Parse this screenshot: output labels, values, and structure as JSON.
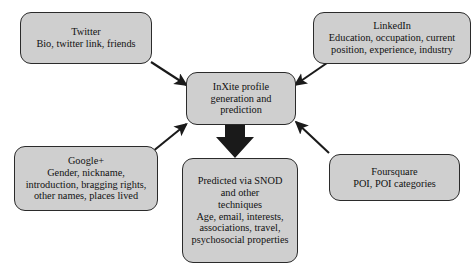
{
  "diagram": {
    "colors": {
      "node_fill": "#cfcfcf",
      "node_border": "#2b2b2b",
      "arrow": "#1a1a1a",
      "background": "#ffffff",
      "text": "#111111"
    },
    "nodes": {
      "twitter": {
        "name": "Twitter",
        "lines": [
          "Twitter",
          "Bio, twitter link, friends"
        ]
      },
      "linkedin": {
        "name": "LinkedIn",
        "lines": [
          "LinkedIn",
          "Education, occupation, current",
          "position, experience, industry"
        ]
      },
      "googleplus": {
        "name": "Google+",
        "lines": [
          "Google+",
          "Gender, nickname,",
          "introduction, bragging rights,",
          "other names, places lived"
        ]
      },
      "foursquare": {
        "name": "Foursquare",
        "lines": [
          "Foursquare",
          "POI, POI categories"
        ]
      },
      "center": {
        "name": "InXite profile generation and prediction",
        "lines": [
          "InXite profile",
          "generation and",
          "prediction"
        ]
      },
      "predicted": {
        "name": "Predicted via SNOD and other techniques",
        "lines": [
          "Predicted via SNOD",
          "and other",
          "techniques",
          "Age, email, interests,",
          "associations, travel,",
          "psychosocial properties"
        ]
      }
    },
    "edges": [
      {
        "from": "twitter",
        "to": "center",
        "style": "thin-arrow"
      },
      {
        "from": "linkedin",
        "to": "center",
        "style": "thin-arrow"
      },
      {
        "from": "googleplus",
        "to": "center",
        "style": "thin-arrow"
      },
      {
        "from": "foursquare",
        "to": "center",
        "style": "thin-arrow"
      },
      {
        "from": "center",
        "to": "predicted",
        "style": "thick-block-arrow"
      }
    ]
  }
}
